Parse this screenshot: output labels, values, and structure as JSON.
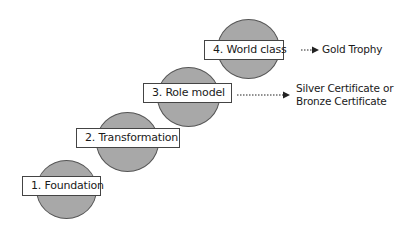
{
  "diagram": {
    "stages": [
      {
        "label": "1. Foundation"
      },
      {
        "label": "2. Transformation"
      },
      {
        "label": "3. Role model"
      },
      {
        "label": "4. World class"
      }
    ],
    "outcomes": [
      {
        "stage": "4. World class",
        "lines": [
          "Gold Trophy"
        ]
      },
      {
        "stage": "3. Role model",
        "lines": [
          "Silver Certificate or",
          "Bronze Certificate"
        ]
      }
    ],
    "colors": {
      "circle_fill": "#a8a8a8",
      "box_fill": "#ffffff",
      "stroke": "#444444"
    }
  }
}
